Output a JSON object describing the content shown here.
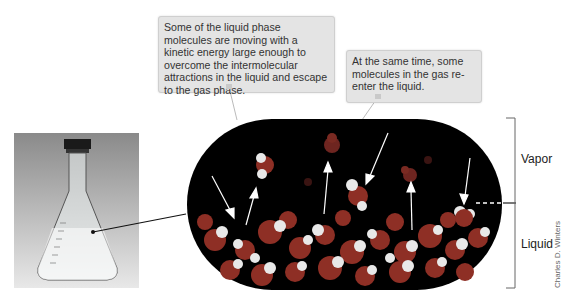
{
  "callouts": {
    "evaporation": "Some of the liquid phase molecules are moving with a kinetic energy large enough to overcome the intermolecular attractions in the liquid and escape to the gas phase.",
    "condensation": "At the same time, some molecules in the gas re-enter the liquid."
  },
  "labels": {
    "vapor": "Vapor",
    "liquid": "Liquid"
  },
  "credit": "Charles D. Winters",
  "colors": {
    "background": "#ffffff",
    "callout_fill": "#e4e4e4",
    "capsule": "#000000",
    "oxygen": "#a23a2e",
    "hydrogen": "#f0f0f0",
    "arrow": "#ffffff",
    "bracket": "#555555"
  }
}
